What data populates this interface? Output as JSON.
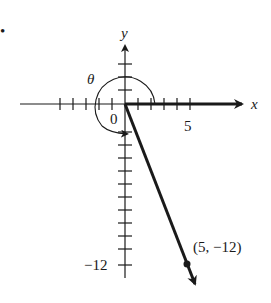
{
  "diagram": {
    "bullet": "•",
    "axes": {
      "x_label": "x",
      "y_label": "y",
      "origin_label": "0",
      "x_tick_label": "5",
      "y_tick_label": "−12"
    },
    "angle_label": "θ",
    "point": {
      "x": 5,
      "y": -12,
      "label": "(5, −12)"
    },
    "colors": {
      "ink": "#1a1a1a",
      "background": "#ffffff"
    }
  }
}
